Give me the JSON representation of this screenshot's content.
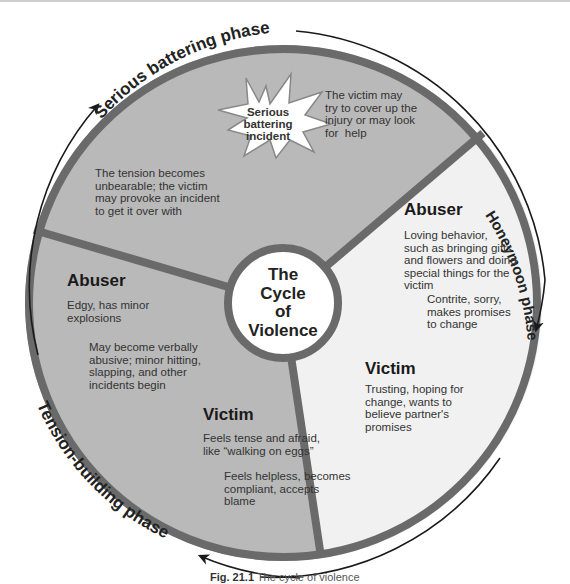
{
  "diagram": {
    "title": "The Cycle of Violence",
    "center": {
      "lines": [
        "The",
        "Cycle",
        "of",
        "Violence"
      ]
    },
    "phases": [
      {
        "name": "Serious battering phase"
      },
      {
        "name": "Honeymoon phase"
      },
      {
        "name": "Tension-building phase"
      }
    ],
    "serious_battering": {
      "burst": [
        "Serious",
        "battering",
        "incident"
      ],
      "left_text": [
        "The tension becomes",
        "unbearable; the victim",
        "may provoke an incident",
        "to get it over with"
      ],
      "right_text": [
        "The victim may",
        "try to cover up the",
        "injury or may look",
        "for  help"
      ]
    },
    "honeymoon": {
      "abuser_heading": "Abuser",
      "abuser_text1": [
        "Loving behavior,",
        "such as bringing gifts",
        "and flowers and doing",
        "special things for the",
        "victim"
      ],
      "abuser_text2": [
        "Contrite, sorry,",
        "makes promises",
        "to change"
      ],
      "victim_heading": "Victim",
      "victim_text": [
        "Trusting, hoping for",
        "change, wants to",
        "believe partner's",
        "promises"
      ]
    },
    "tension_building": {
      "abuser_heading": "Abuser",
      "abuser_text1": [
        "Edgy, has minor",
        "explosions"
      ],
      "abuser_text2": [
        "May become verbally",
        "abusive; minor hitting,",
        "slapping, and other",
        "incidents begin"
      ],
      "victim_heading": "Victim",
      "victim_text1": [
        "Feels tense and afraid,",
        "like “walking on eggs”"
      ],
      "victim_text2": [
        "Feels helpless, becomes",
        "compliant, accepts",
        "blame"
      ]
    },
    "colors": {
      "dark_sector": "#b9b9b9",
      "light_sector": "#f1f1f1",
      "border": "#6a6a6a",
      "arrow": "#1a1a1a"
    },
    "caption": {
      "label": "Fig. 21.1",
      "text": "The cycle of violence"
    }
  }
}
